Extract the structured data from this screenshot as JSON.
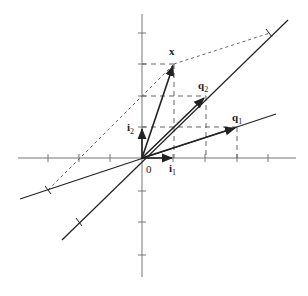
{
  "figure": {
    "origin_px": [
      142,
      158
    ],
    "unit_px": 31.5,
    "colors": {
      "axis": "#666666",
      "line": "#222222",
      "dashed": "#555555"
    },
    "labels": {
      "x": "x",
      "q1": "q",
      "q1_sub": "1",
      "q2": "q",
      "q2_sub": "2",
      "i1": "i",
      "i1_sub": "1",
      "i2": "i",
      "i2_sub": "2",
      "origin": "0"
    },
    "vectors": {
      "i1": [
        1,
        0
      ],
      "i2": [
        0,
        1
      ],
      "q1": [
        3,
        1
      ],
      "q2": [
        2,
        2
      ],
      "x": [
        1,
        3
      ]
    },
    "coefficients": {
      "q1": -1,
      "q2": 2
    }
  }
}
